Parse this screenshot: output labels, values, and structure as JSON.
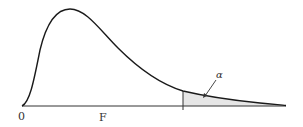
{
  "diagram": {
    "type": "F-distribution density with shaded right tail",
    "labels": {
      "origin": "0",
      "axis": "F",
      "tail": "α"
    },
    "colors": {
      "curve": "#1a1a1a",
      "axis": "#333333",
      "shade": "#e6e6e6"
    }
  }
}
